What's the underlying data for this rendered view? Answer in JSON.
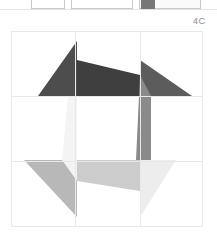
{
  "top_strip": {
    "swatch_color": "#777777",
    "chips": [
      "",
      "",
      ""
    ]
  },
  "plate": {
    "label": "4C"
  },
  "figure": {
    "name": "pinwheel-quilt-block",
    "grid": {
      "columns": 3,
      "rows": 3,
      "line_color": "#e8e8e8",
      "x_positions": [
        0,
        64,
        129,
        192
      ],
      "y_positions": [
        0,
        65,
        130,
        196
      ]
    },
    "background": "#ffffff",
    "palette": {
      "darkest": "#3f3f3f",
      "dark": "#4d4d4d",
      "medium_dark": "#5c5c5c",
      "medium": "#8a8a8a",
      "light": "#b8b8b8",
      "lighter": "#cccccc",
      "lightest": "#ededed",
      "near_white": "#f4f4f4"
    },
    "shapes": [
      {
        "name": "top-left-triangle",
        "fill": "#4d4d4d",
        "points": "27,65 66,10 66,65"
      },
      {
        "name": "top-center-bar",
        "fill": "#3f3f3f",
        "points": "66,29 129,44 129,65 66,65"
      },
      {
        "name": "top-right-triangle",
        "fill": "#5c5c5c",
        "points": "129,29 181,65 129,65"
      },
      {
        "name": "right-vertical-quad",
        "fill": "#8a8a8a",
        "points": "129,44 140,65 140,129 125,129"
      },
      {
        "name": "bottom-right-triangle",
        "fill": "#ededed",
        "points": "129,129 165,129 129,186"
      },
      {
        "name": "bottom-center-quad",
        "fill": "#cccccc",
        "points": "66,129 129,129 129,160 66,150"
      },
      {
        "name": "bottom-left-triangle",
        "fill": "#b8b8b8",
        "points": "13,129 66,129 66,186"
      },
      {
        "name": "left-vertical-quad",
        "fill": "#f4f4f4",
        "points": "57,65 66,65 66,150 51,129"
      }
    ]
  }
}
